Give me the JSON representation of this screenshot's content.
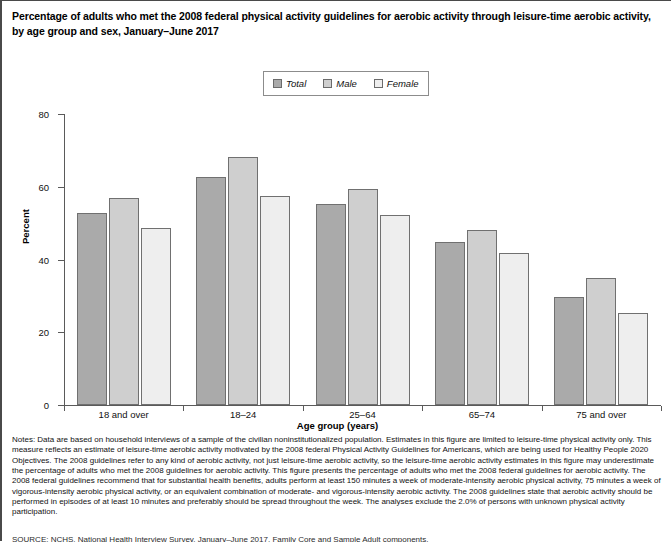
{
  "title": {
    "line1": "Percentage of adults who met the 2008 federal physical activity guidelines for aerobic activity through leisure-time aerobic activity,",
    "line2": "by age group and sex, January–June 2017"
  },
  "legend": {
    "entries": [
      {
        "label": "Total",
        "color": "#aaaaaa"
      },
      {
        "label": "Male",
        "color": "#cfcfcf"
      },
      {
        "label": "Female",
        "color": "#eeeeee"
      }
    ]
  },
  "axes": {
    "y_title": "Percent",
    "x_title": "Age group (years)",
    "y_ticks": [
      "0",
      "20",
      "40",
      "60",
      "80"
    ]
  },
  "chart_data": {
    "type": "bar",
    "title": "Percentage of adults who met the 2008 federal physical activity guidelines for aerobic activity through leisure-time aerobic activity, by age group and sex, January–June 2017",
    "xlabel": "Age group (years)",
    "ylabel": "Percent",
    "ylim": [
      0,
      80
    ],
    "yticks": [
      0,
      20,
      40,
      60,
      80
    ],
    "grid": false,
    "legend_position": "top-center",
    "categories": [
      "18 and over",
      "18–24",
      "25–64",
      "65–74",
      "75 and over"
    ],
    "series": [
      {
        "name": "Total",
        "color": "#aaaaaa",
        "values": [
          52.8,
          62.8,
          55.3,
          44.7,
          29.8
        ]
      },
      {
        "name": "Male",
        "color": "#cfcfcf",
        "values": [
          56.9,
          68.3,
          59.4,
          48.0,
          34.9
        ]
      },
      {
        "name": "Female",
        "color": "#eeeeee",
        "values": [
          48.8,
          57.5,
          52.3,
          41.7,
          25.3
        ]
      }
    ]
  },
  "notes": {
    "text": "Notes: Data are based on household interviews of a sample of the civilian noninstitutionalized population. Estimates in this figure are limited to leisure-time physical activity only. This measure reflects an estimate of leisure-time aerobic activity motivated by the 2008 federal Physical Activity Guidelines for Americans, which are being used for Healthy People 2020 Objectives. The 2008 guidelines refer to any kind of aerobic activity, not just leisure-time aerobic activity, so the leisure-time aerobic activity estimates in this figure may underestimate the percentage of adults who met the 2008 guidelines for aerobic activity. This figure presents the percentage of adults who met the 2008 federal guidelines for aerobic activity. The 2008 federal guidelines recommend that for substantial health benefits, adults perform at least 150 minutes a week of moderate-intensity aerobic physical activity, 75 minutes a week of vigorous-intensity aerobic physical activity, or an equivalent combination of moderate- and vigorous-intensity aerobic activity. The 2008 guidelines state that aerobic activity should be performed in episodes of at least 10 minutes and preferably should be spread throughout the week. The analyses exclude the 2.0% of persons with unknown physical activity participation."
  },
  "footer": {
    "cut_text": "SOURCE: NCHS, National Health Interview Survey, January–June 2017, Family Core and Sample Adult components."
  }
}
